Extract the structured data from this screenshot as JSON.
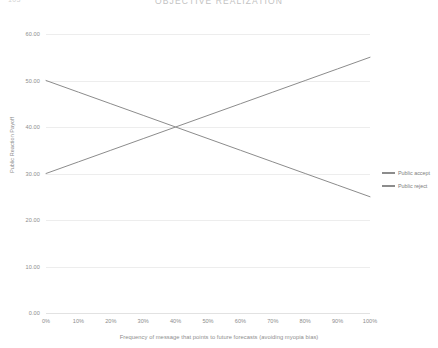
{
  "header": {
    "left_label": "103",
    "title": "OBJECTIVE REALIZATION"
  },
  "chart_data": {
    "type": "line",
    "title": "OBJECTIVE REALIZATION",
    "xlabel": "Frequency of message that points to future forecasts (avoiding myopia bias)",
    "ylabel": "Public Reaction Payoff",
    "x": [
      0,
      10,
      20,
      30,
      40,
      50,
      60,
      70,
      80,
      90,
      100
    ],
    "xtick_labels": [
      "0%",
      "10%",
      "20%",
      "30%",
      "40%",
      "50%",
      "60%",
      "70%",
      "80%",
      "90%",
      "100%"
    ],
    "ytick_labels": [
      "0.00",
      "10.00",
      "20.00",
      "30.00",
      "40.00",
      "50.00",
      "60.00"
    ],
    "ytick_values": [
      0,
      10,
      20,
      30,
      40,
      50,
      60
    ],
    "xlim": [
      0,
      100
    ],
    "ylim": [
      0,
      60
    ],
    "grid": true,
    "legend_position": "right",
    "series": [
      {
        "name": "Public accept",
        "color": "#8c8c8c",
        "values": [
          50.0,
          47.5,
          45.0,
          42.5,
          40.0,
          37.5,
          35.0,
          32.5,
          30.0,
          27.5,
          25.0
        ]
      },
      {
        "name": "Public reject",
        "color": "#8c8c8c",
        "values": [
          30.0,
          32.5,
          35.0,
          37.5,
          40.0,
          42.5,
          45.0,
          47.5,
          50.0,
          52.5,
          55.0
        ]
      }
    ]
  },
  "colors": {
    "background": "#ffffff",
    "gridline": "#ededed",
    "axis_text": "#8d8d8d",
    "line": "#8c8c8c"
  }
}
